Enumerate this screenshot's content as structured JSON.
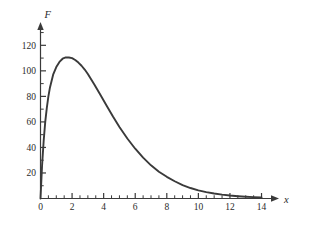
{
  "figure": {
    "background_color": "#ffffff",
    "axis_color": "#3a3a3a",
    "curve_color": "#3a3a3a"
  },
  "axes": {
    "x_axis_label": "x",
    "y_axis_label": "F",
    "x_ticks": [
      "0",
      "2",
      "4",
      "6",
      "8",
      "10",
      "12",
      "14"
    ],
    "y_ticks": [
      "20",
      "40",
      "60",
      "80",
      "100",
      "120"
    ],
    "origin_label": "0"
  },
  "chart_data": {
    "type": "line",
    "title": "",
    "xlabel": "x",
    "ylabel": "F",
    "xlim": [
      0,
      14.6
    ],
    "ylim": [
      0,
      132
    ],
    "grid": false,
    "legend": "none",
    "x_major_ticks": [
      0,
      2,
      4,
      6,
      8,
      10,
      12,
      14
    ],
    "x_minor_tick_step": 0.5,
    "y_major_ticks": [
      20,
      40,
      60,
      80,
      100,
      120
    ],
    "y_minor_tick_step": 10,
    "peak": {
      "x": 2.0,
      "y": 110
    },
    "series": [
      {
        "name": "F(x)",
        "x": [
          0.0,
          0.1,
          0.2,
          0.3,
          0.4,
          0.5,
          0.6,
          0.8,
          1.0,
          1.2,
          1.4,
          1.6,
          1.8,
          2.0,
          2.2,
          2.4,
          2.6,
          2.8,
          3.0,
          3.4,
          3.8,
          4.2,
          4.6,
          5.0,
          5.5,
          6.0,
          6.5,
          7.0,
          7.5,
          8.0,
          8.5,
          9.0,
          9.5,
          10.0,
          10.5,
          11.0,
          11.5,
          12.0,
          12.5,
          13.0,
          13.5,
          14.0
        ],
        "values": [
          0,
          26,
          45,
          60,
          71,
          80,
          87,
          97,
          103,
          107,
          109.5,
          110.5,
          110.5,
          110,
          108.5,
          106.5,
          104,
          101,
          97.5,
          89.5,
          81,
          72.5,
          64,
          56,
          47,
          39,
          32,
          26,
          21,
          17,
          13.5,
          10.5,
          8.2,
          6.4,
          5.0,
          3.9,
          3.0,
          2.3,
          1.8,
          1.4,
          1.1,
          0.9
        ]
      }
    ]
  }
}
